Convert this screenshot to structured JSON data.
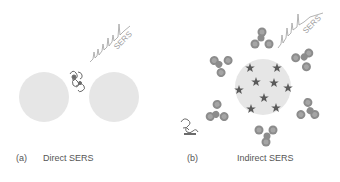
{
  "panels": [
    {
      "id": "a",
      "label": "(a)",
      "title": "Direct SERS",
      "spectrum_label": "SERS"
    },
    {
      "id": "b",
      "label": "(b)",
      "title": "Indirect SERS",
      "spectrum_label": "SERS"
    }
  ],
  "colors": {
    "nanoparticle": "#e6e6e6",
    "protein": "#6b6b6b",
    "star": "#5a5a5a",
    "antibody": "#8c8c8c",
    "spectrum": "#a0a0a0",
    "text": "#555555"
  }
}
